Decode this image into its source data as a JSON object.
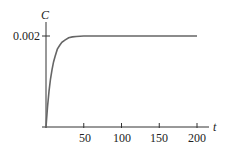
{
  "chart_data": {
    "type": "line",
    "title": "",
    "xlabel": "t",
    "ylabel": "C",
    "xlim": [
      0,
      215
    ],
    "ylim": [
      0,
      0.0022
    ],
    "x_ticks": [
      50,
      100,
      150,
      200
    ],
    "x_tick_labels": [
      "50",
      "100",
      "150",
      "200"
    ],
    "y_ticks": [
      0.002
    ],
    "y_tick_labels": [
      "0.002"
    ],
    "grid": false,
    "legend": null,
    "series": [
      {
        "name": "C(t)",
        "color": "#666666",
        "x": [
          0,
          2,
          4,
          6,
          8,
          10,
          12,
          15,
          18,
          21,
          25,
          30,
          35,
          40,
          50,
          60,
          80,
          100,
          120,
          150,
          180,
          200
        ],
        "y": [
          0,
          0.00044,
          0.00079,
          0.00106,
          0.00126,
          0.00143,
          0.00155,
          0.00171,
          0.00179,
          0.00186,
          0.00191,
          0.00196,
          0.00198,
          0.00199,
          0.002,
          0.002,
          0.002,
          0.002,
          0.002,
          0.002,
          0.002,
          0.002
        ]
      }
    ]
  },
  "labels": {
    "y_axis": "C",
    "x_axis": "t",
    "y_tick_0": "0.002",
    "x_tick_0": "50",
    "x_tick_1": "100",
    "x_tick_2": "150",
    "x_tick_3": "200"
  }
}
